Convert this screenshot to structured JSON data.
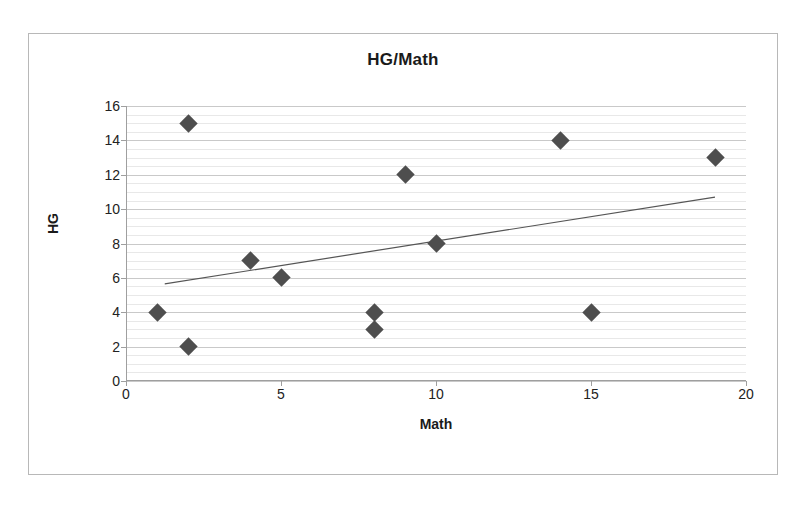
{
  "chart_data": {
    "type": "scatter",
    "title": "HG/Math",
    "xlabel": "Math",
    "ylabel": "HG",
    "xlim": [
      0,
      20
    ],
    "ylim": [
      0,
      16
    ],
    "x_ticks": [
      0,
      5,
      10,
      15,
      20
    ],
    "y_ticks": [
      0,
      2,
      4,
      6,
      8,
      10,
      12,
      14,
      16
    ],
    "x_tick_labels": [
      "0",
      "5",
      "10",
      "15",
      "20"
    ],
    "y_tick_labels": [
      "0",
      "2",
      "4",
      "6",
      "8",
      "10",
      "12",
      "14",
      "16"
    ],
    "grid": true,
    "minor_grid": true,
    "minor_grid_step": 0.5,
    "legend": false,
    "marker_shape": "diamond",
    "marker_color": "#4e4e4e",
    "trendline": {
      "type": "linear",
      "color": "#555555",
      "x_start": 1.25,
      "y_start": 5.65,
      "x_end": 19.0,
      "y_end": 10.7
    },
    "series": [
      {
        "name": "HG vs Math",
        "points": [
          {
            "x": 1,
            "y": 4
          },
          {
            "x": 2,
            "y": 15
          },
          {
            "x": 2,
            "y": 2
          },
          {
            "x": 4,
            "y": 7
          },
          {
            "x": 5,
            "y": 6
          },
          {
            "x": 8,
            "y": 4
          },
          {
            "x": 8,
            "y": 3
          },
          {
            "x": 9,
            "y": 12
          },
          {
            "x": 10,
            "y": 8
          },
          {
            "x": 14,
            "y": 14
          },
          {
            "x": 15,
            "y": 4
          },
          {
            "x": 19,
            "y": 13
          }
        ]
      }
    ]
  }
}
